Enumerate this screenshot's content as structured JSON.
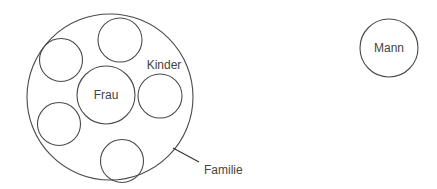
{
  "diagram": {
    "family": {
      "label": "Familie",
      "wife": {
        "label": "Frau"
      },
      "children": {
        "label": "Kinder",
        "count": 5
      }
    },
    "man": {
      "label": "Mann"
    }
  },
  "colors": {
    "stroke": "#4a4a4a",
    "text": "#444444",
    "background": "#ffffff"
  }
}
